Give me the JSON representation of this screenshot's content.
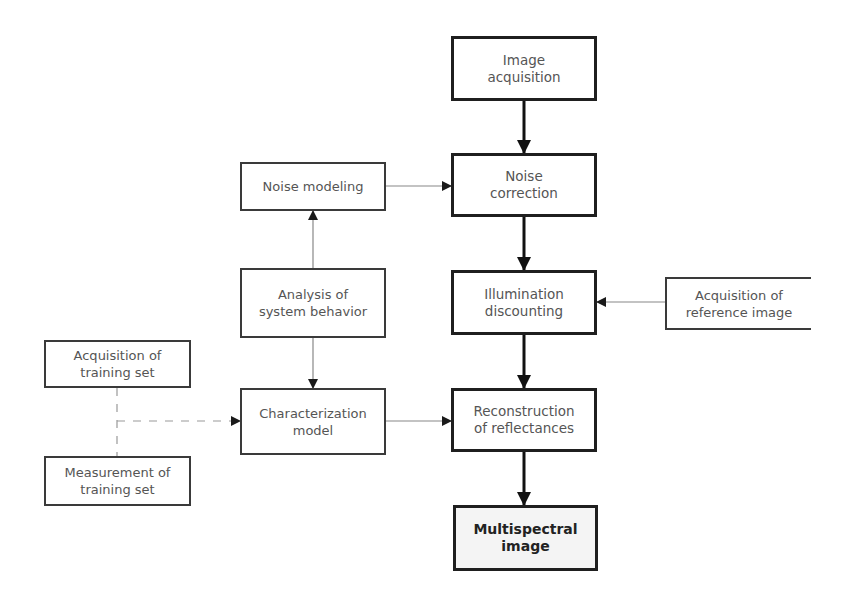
{
  "diagram": {
    "type": "flowchart",
    "nodes": [
      {
        "id": "image_acquisition",
        "label": "Image\nacquisition"
      },
      {
        "id": "noise_correction",
        "label": "Noise\ncorrection"
      },
      {
        "id": "illumination_discounting",
        "label": "Illumination\ndiscounting"
      },
      {
        "id": "reconstruction",
        "label": "Reconstruction\nof reflectances"
      },
      {
        "id": "multispectral_image",
        "label": "Multispectral\nimage"
      },
      {
        "id": "noise_modeling",
        "label": "Noise modeling"
      },
      {
        "id": "analysis_system",
        "label": "Analysis of\nsystem behavior"
      },
      {
        "id": "characterization_model",
        "label": "Characterization\nmodel"
      },
      {
        "id": "acq_training_set",
        "label": "Acquisition of\ntraining set"
      },
      {
        "id": "meas_training_set",
        "label": "Measurement of\ntraining set"
      },
      {
        "id": "acq_reference_image",
        "label": "Acquisition of\nreference image"
      }
    ],
    "edges": [
      {
        "from": "image_acquisition",
        "to": "noise_correction",
        "style": "thick"
      },
      {
        "from": "noise_correction",
        "to": "illumination_discounting",
        "style": "thick"
      },
      {
        "from": "illumination_discounting",
        "to": "reconstruction",
        "style": "thick"
      },
      {
        "from": "reconstruction",
        "to": "multispectral_image",
        "style": "thick"
      },
      {
        "from": "noise_modeling",
        "to": "noise_correction",
        "style": "thin"
      },
      {
        "from": "analysis_system",
        "to": "noise_modeling",
        "style": "thin"
      },
      {
        "from": "analysis_system",
        "to": "characterization_model",
        "style": "thin"
      },
      {
        "from": "characterization_model",
        "to": "reconstruction",
        "style": "thin"
      },
      {
        "from": "acq_reference_image",
        "to": "illumination_discounting",
        "style": "thin"
      },
      {
        "from": "acq_training_set",
        "to": "characterization_model",
        "style": "dashed"
      },
      {
        "from": "meas_training_set",
        "to": "characterization_model",
        "style": "dashed"
      }
    ]
  }
}
